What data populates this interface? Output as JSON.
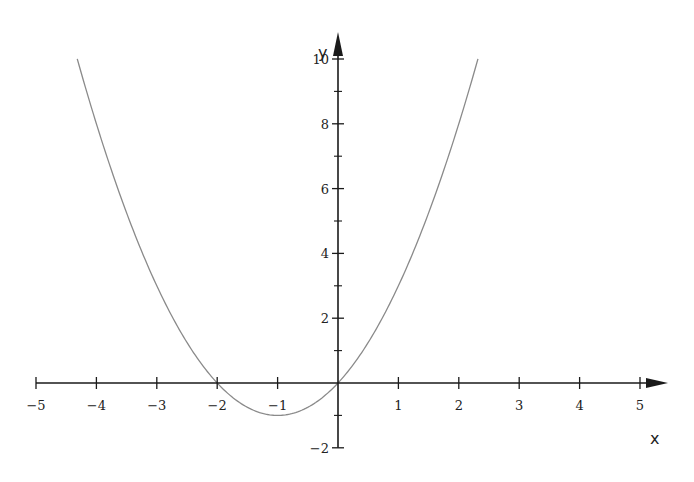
{
  "chart_data": {
    "type": "line",
    "title": "",
    "function": "y = x^2 + 2x",
    "xlabel": "x",
    "ylabel": "y",
    "xlim": [
      -5,
      5
    ],
    "ylim": [
      -2,
      10
    ],
    "grid": false,
    "legend": null,
    "x_ticks": [
      -5,
      -4,
      -3,
      -2,
      -1,
      1,
      2,
      3,
      4,
      5
    ],
    "x_tick_labels": [
      "−5",
      "−4",
      "−3",
      "−2",
      "−1",
      "1",
      "2",
      "3",
      "4",
      "5"
    ],
    "y_ticks": [
      -2,
      2,
      4,
      6,
      8,
      10
    ],
    "y_tick_labels": [
      "−2",
      "2",
      "4",
      "6",
      "8",
      "10"
    ],
    "y_minor_ticks": [
      -1,
      1,
      3,
      5,
      7,
      9
    ],
    "series": [
      {
        "name": "x^2+2x",
        "color": "#8a8a8a",
        "x": [
          -4.317,
          -4,
          -3.5,
          -3,
          -2.5,
          -2,
          -1.5,
          -1,
          -0.5,
          0,
          0.5,
          1,
          1.5,
          2,
          2.317
        ],
        "y": [
          10,
          8,
          5.25,
          3,
          1.25,
          0,
          -0.75,
          -1,
          -0.75,
          0,
          1.25,
          3,
          5.25,
          8,
          10
        ]
      }
    ],
    "key_points": {
      "roots": [
        -2,
        0
      ],
      "vertex": [
        -1,
        -1
      ]
    }
  },
  "colors": {
    "axis": "#1a1a1a",
    "curve": "#8a8a8a",
    "background": "#ffffff"
  }
}
